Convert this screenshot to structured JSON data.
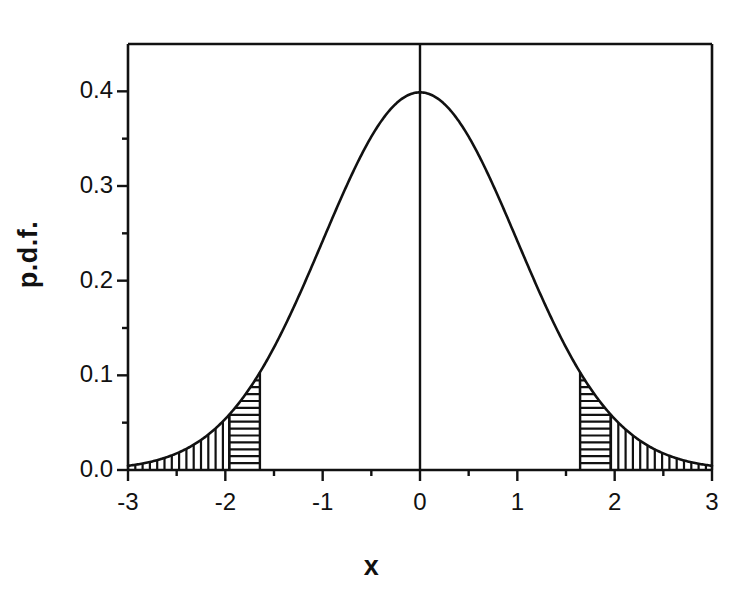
{
  "figure": {
    "background_color": "#ffffff",
    "ink_color": "#111111",
    "width": 743,
    "height": 596
  },
  "axes": {
    "x_title": "x",
    "y_title": "p.d.f.",
    "x_tick_labels": [
      "-3",
      "-2",
      "-1",
      "0",
      "1",
      "2",
      "3"
    ],
    "y_tick_labels": [
      "0.0",
      "0.1",
      "0.2",
      "0.3",
      "0.4"
    ]
  },
  "chart_data": {
    "type": "line",
    "title": "",
    "subtitle": "",
    "xlabel": "x",
    "ylabel": "p.d.f.",
    "xlim": [
      -3,
      3
    ],
    "ylim": [
      0,
      0.45
    ],
    "grid": false,
    "legend": null,
    "x_ticks": [
      -3,
      -2,
      -1,
      0,
      1,
      2,
      3
    ],
    "x_tick_labels": [
      "-3",
      "-2",
      "-1",
      "0",
      "1",
      "2",
      "3"
    ],
    "x_minor_ticks": [
      -2.5,
      -1.5,
      -0.5,
      0.5,
      1.5,
      2.5
    ],
    "y_ticks": [
      0.0,
      0.1,
      0.2,
      0.3,
      0.4
    ],
    "y_tick_labels": [
      "0.0",
      "0.1",
      "0.2",
      "0.3",
      "0.4"
    ],
    "y_minor_ticks": [
      0.05,
      0.15,
      0.25,
      0.35
    ],
    "series": [
      {
        "name": "standard normal p.d.f.",
        "distribution": "normal",
        "mean": 0,
        "sd": 1,
        "peak_value": 0.3989,
        "x": [
          -3.0,
          -2.8,
          -2.6,
          -2.4,
          -2.2,
          -2.0,
          -1.96,
          -1.8,
          -1.645,
          -1.6,
          -1.4,
          -1.2,
          -1.0,
          -0.8,
          -0.6,
          -0.4,
          -0.2,
          0.0,
          0.2,
          0.4,
          0.6,
          0.8,
          1.0,
          1.2,
          1.4,
          1.6,
          1.645,
          1.8,
          1.96,
          2.0,
          2.2,
          2.4,
          2.6,
          2.8,
          3.0
        ],
        "y": [
          0.0044,
          0.0079,
          0.0136,
          0.0224,
          0.0355,
          0.054,
          0.0584,
          0.079,
          0.1031,
          0.1109,
          0.1497,
          0.1942,
          0.242,
          0.2897,
          0.3332,
          0.3683,
          0.391,
          0.3989,
          0.391,
          0.3683,
          0.3332,
          0.2897,
          0.242,
          0.1942,
          0.1497,
          0.1109,
          0.1031,
          0.079,
          0.0584,
          0.054,
          0.0355,
          0.0224,
          0.0136,
          0.0079,
          0.0044
        ]
      }
    ],
    "vertical_lines": [
      {
        "name": "center-line",
        "x": 0,
        "y_from": 0,
        "y_to": 0.45
      }
    ],
    "shaded_regions": [
      {
        "name": "left-outer-tail",
        "x_from": -3.0,
        "x_to": -1.96,
        "hatch": "vertical"
      },
      {
        "name": "left-inner-tail",
        "x_from": -1.96,
        "x_to": -1.645,
        "hatch": "horizontal"
      },
      {
        "name": "right-inner-tail",
        "x_from": 1.645,
        "x_to": 1.96,
        "hatch": "horizontal"
      },
      {
        "name": "right-outer-tail",
        "x_from": 1.96,
        "x_to": 3.0,
        "hatch": "vertical"
      }
    ]
  }
}
